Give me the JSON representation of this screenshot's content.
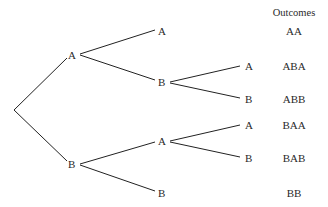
{
  "diagram": {
    "type": "probability-tree",
    "outcomes_header": "Outcomes",
    "nodes": [
      {
        "id": "root",
        "label": "",
        "x": 14,
        "y": 110
      },
      {
        "id": "A",
        "label": "A",
        "x": 72,
        "y": 55
      },
      {
        "id": "B",
        "label": "B",
        "x": 72,
        "y": 164
      },
      {
        "id": "AA",
        "label": "A",
        "x": 162,
        "y": 31
      },
      {
        "id": "AB",
        "label": "B",
        "x": 162,
        "y": 82
      },
      {
        "id": "BA",
        "label": "A",
        "x": 162,
        "y": 141
      },
      {
        "id": "BB",
        "label": "B",
        "x": 162,
        "y": 193
      },
      {
        "id": "ABA",
        "label": "A",
        "x": 248,
        "y": 66
      },
      {
        "id": "ABB",
        "label": "B",
        "x": 248,
        "y": 99
      },
      {
        "id": "BAA",
        "label": "A",
        "x": 248,
        "y": 125
      },
      {
        "id": "BAB",
        "label": "B",
        "x": 248,
        "y": 158
      }
    ],
    "edges": [
      {
        "from": "root",
        "to": "A"
      },
      {
        "from": "root",
        "to": "B"
      },
      {
        "from": "A",
        "to": "AA"
      },
      {
        "from": "A",
        "to": "AB"
      },
      {
        "from": "B",
        "to": "BA"
      },
      {
        "from": "B",
        "to": "BB"
      },
      {
        "from": "AB",
        "to": "ABA"
      },
      {
        "from": "AB",
        "to": "ABB"
      },
      {
        "from": "BA",
        "to": "BAA"
      },
      {
        "from": "BA",
        "to": "BAB"
      }
    ],
    "outcomes": [
      {
        "label": "AA",
        "y": 31
      },
      {
        "label": "ABA",
        "y": 66
      },
      {
        "label": "ABB",
        "y": 99
      },
      {
        "label": "BAA",
        "y": 125
      },
      {
        "label": "BAB",
        "y": 158
      },
      {
        "label": "BB",
        "y": 193
      }
    ],
    "colors": {
      "line": "#222222",
      "text": "#2a2a2a",
      "background": "#ffffff"
    }
  }
}
